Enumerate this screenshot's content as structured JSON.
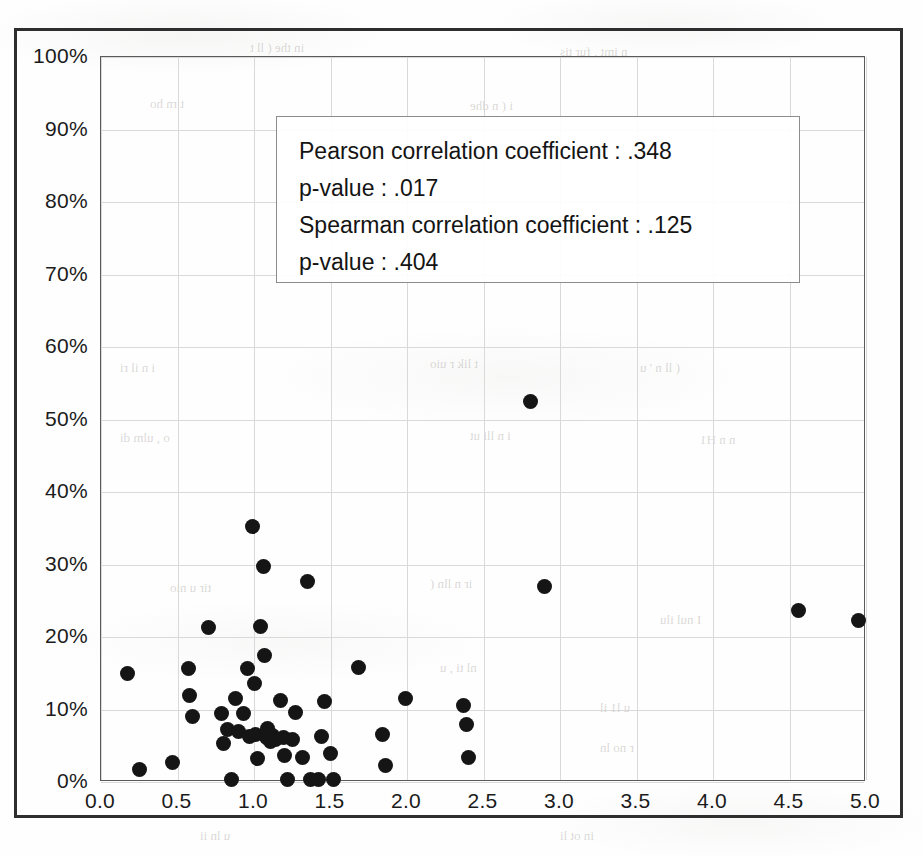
{
  "figure": {
    "background_color": "#fefefe",
    "point_color": "#151515",
    "grid_color": "#d9d9d9",
    "axis_color": "#5a5a5a",
    "frame_color": "#2e2e2e"
  },
  "annotation": {
    "lines": [
      "Pearson correlation coefficient :  .348",
      "p-value :  .017",
      "Spearman correlation coefficient :  .125",
      "p-value :  .404"
    ],
    "pearson_correlation_coefficient": ".348",
    "pearson_p_value": ".017",
    "spearman_correlation_coefficient": ".125",
    "spearman_p_value": ".404"
  },
  "chart_data": {
    "type": "scatter",
    "title": "",
    "xlabel": "",
    "ylabel": "",
    "xlim": [
      0.0,
      5.0
    ],
    "ylim": [
      0,
      100
    ],
    "grid": true,
    "legend": "none",
    "xticks": [
      "0.0",
      "0.5",
      "1.0",
      "1.5",
      "2.0",
      "2.5",
      "3.0",
      "3.5",
      "4.0",
      "4.5",
      "5.0"
    ],
    "xtick_values": [
      0.0,
      0.5,
      1.0,
      1.5,
      2.0,
      2.5,
      3.0,
      3.5,
      4.0,
      4.5,
      5.0
    ],
    "yticks": [
      "0%",
      "10%",
      "20%",
      "30%",
      "40%",
      "50%",
      "60%",
      "70%",
      "80%",
      "90%",
      "100%"
    ],
    "ytick_values": [
      0,
      10,
      20,
      30,
      40,
      50,
      60,
      70,
      80,
      90,
      100
    ],
    "points": [
      {
        "x": 0.17,
        "y": 14.9
      },
      {
        "x": 0.25,
        "y": 1.7
      },
      {
        "x": 0.47,
        "y": 2.7
      },
      {
        "x": 0.57,
        "y": 15.6
      },
      {
        "x": 0.58,
        "y": 12.0
      },
      {
        "x": 0.6,
        "y": 9.1
      },
      {
        "x": 0.7,
        "y": 21.3
      },
      {
        "x": 0.79,
        "y": 9.4
      },
      {
        "x": 0.8,
        "y": 5.3
      },
      {
        "x": 0.83,
        "y": 7.3
      },
      {
        "x": 0.85,
        "y": 0.3
      },
      {
        "x": 0.88,
        "y": 11.5
      },
      {
        "x": 0.9,
        "y": 7.0
      },
      {
        "x": 0.93,
        "y": 9.5
      },
      {
        "x": 0.96,
        "y": 15.6
      },
      {
        "x": 0.97,
        "y": 6.3
      },
      {
        "x": 0.99,
        "y": 35.2
      },
      {
        "x": 1.0,
        "y": 13.6
      },
      {
        "x": 1.01,
        "y": 6.6
      },
      {
        "x": 1.02,
        "y": 3.3
      },
      {
        "x": 1.04,
        "y": 21.4
      },
      {
        "x": 1.06,
        "y": 29.7
      },
      {
        "x": 1.07,
        "y": 17.4
      },
      {
        "x": 1.08,
        "y": 6.1
      },
      {
        "x": 1.09,
        "y": 7.4
      },
      {
        "x": 1.11,
        "y": 5.6
      },
      {
        "x": 1.12,
        "y": 6.4
      },
      {
        "x": 1.14,
        "y": 5.9
      },
      {
        "x": 1.17,
        "y": 11.2
      },
      {
        "x": 1.19,
        "y": 6.1
      },
      {
        "x": 1.2,
        "y": 3.6
      },
      {
        "x": 1.22,
        "y": 0.3
      },
      {
        "x": 1.25,
        "y": 5.8
      },
      {
        "x": 1.27,
        "y": 9.6
      },
      {
        "x": 1.32,
        "y": 3.4
      },
      {
        "x": 1.35,
        "y": 27.6
      },
      {
        "x": 1.37,
        "y": 0.3
      },
      {
        "x": 1.42,
        "y": 0.3
      },
      {
        "x": 1.44,
        "y": 6.3
      },
      {
        "x": 1.46,
        "y": 11.1
      },
      {
        "x": 1.5,
        "y": 3.9
      },
      {
        "x": 1.52,
        "y": 0.3
      },
      {
        "x": 1.68,
        "y": 15.8
      },
      {
        "x": 1.84,
        "y": 6.5
      },
      {
        "x": 1.86,
        "y": 2.3
      },
      {
        "x": 1.99,
        "y": 11.5
      },
      {
        "x": 2.37,
        "y": 10.6
      },
      {
        "x": 2.39,
        "y": 8.0
      },
      {
        "x": 2.4,
        "y": 3.4
      },
      {
        "x": 2.81,
        "y": 52.5
      },
      {
        "x": 2.9,
        "y": 26.9
      },
      {
        "x": 4.56,
        "y": 23.6
      },
      {
        "x": 4.95,
        "y": 22.3
      }
    ],
    "n_points": 53,
    "statistics": {
      "pearson_r": 0.348,
      "pearson_p": 0.017,
      "spearman_rho": 0.125,
      "spearman_p": 0.404
    }
  },
  "ghost_text": [
    {
      "text": "in the  ( ll  t",
      "x": 250,
      "y": 40
    },
    {
      "text": "n  imt   ,  fur  tis",
      "x": 560,
      "y": 44
    },
    {
      "text": "t  rn   ho",
      "x": 150,
      "y": 96
    },
    {
      "text": "i  ( n    dhe",
      "x": 470,
      "y": 98
    },
    {
      "text": "i  n   il     ri",
      "x": 120,
      "y": 360
    },
    {
      "text": "t  lik     r   uio",
      "x": 430,
      "y": 356
    },
    {
      "text": "(   ll    n  '  u",
      "x": 640,
      "y": 360
    },
    {
      "text": "o   ,  ulm   di",
      "x": 120,
      "y": 430
    },
    {
      "text": "i   n  lli   ut",
      "x": 470,
      "y": 428
    },
    {
      "text": "n  n    H1",
      "x": 700,
      "y": 432
    },
    {
      "text": "tir     u   nio",
      "x": 170,
      "y": 580
    },
    {
      "text": "ir  n  lln   (",
      "x": 430,
      "y": 576
    },
    {
      "text": "I  nul    ilu",
      "x": 660,
      "y": 612
    },
    {
      "text": "nl  ti  ,  u",
      "x": 440,
      "y": 660
    },
    {
      "text": "u    l1  il",
      "x": 600,
      "y": 700
    },
    {
      "text": "r  no    ln",
      "x": 600,
      "y": 740
    },
    {
      "text": "in  ot  li",
      "x": 560,
      "y": 828
    },
    {
      "text": "u  ln  ii",
      "x": 200,
      "y": 828
    }
  ]
}
